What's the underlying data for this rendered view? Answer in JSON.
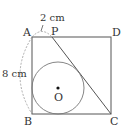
{
  "figure": {
    "type": "geometry",
    "points": {
      "A": "A",
      "P": "P",
      "D": "D",
      "B": "B",
      "C": "C",
      "O": "O"
    },
    "dimensions": {
      "AP": "2 cm",
      "AB": "8 cm"
    },
    "colors": {
      "line": "#555555",
      "dashed": "#999999",
      "text": "#333333"
    }
  }
}
